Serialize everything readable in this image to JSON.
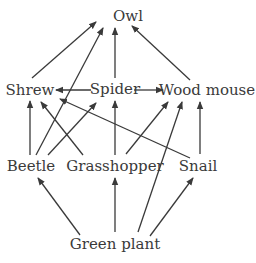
{
  "diagram": {
    "type": "food-web",
    "cut_off_caption": "...ing ... food ... web ... p",
    "colors": {
      "line": "#3a3a3a",
      "text": "#3a3a3a",
      "background": "#ffffff"
    },
    "nodes": {
      "owl": {
        "label": "Owl",
        "x": 128,
        "y": 16
      },
      "shrew": {
        "label": "Shrew",
        "x": 32,
        "y": 90
      },
      "spider": {
        "label": "Spider",
        "x": 115,
        "y": 88
      },
      "wood_mouse": {
        "label": "Wood mouse",
        "x": 205,
        "y": 90
      },
      "beetle": {
        "label": "Beetle",
        "x": 30,
        "y": 165
      },
      "grasshopper": {
        "label": "Grasshopper",
        "x": 115,
        "y": 165
      },
      "snail": {
        "label": "Snail",
        "x": 205,
        "y": 165
      },
      "green_plant": {
        "label": "Green plant",
        "x": 115,
        "y": 243
      }
    },
    "edges": [
      {
        "from": "shrew",
        "to": "owl"
      },
      {
        "from": "beetle",
        "to": "owl"
      },
      {
        "from": "spider",
        "to": "owl"
      },
      {
        "from": "wood_mouse",
        "to": "owl"
      },
      {
        "from": "spider",
        "to": "shrew"
      },
      {
        "from": "spider",
        "to": "wood_mouse"
      },
      {
        "from": "beetle",
        "to": "shrew"
      },
      {
        "from": "grasshopper",
        "to": "shrew"
      },
      {
        "from": "snail",
        "to": "shrew"
      },
      {
        "from": "beetle",
        "to": "spider"
      },
      {
        "from": "grasshopper",
        "to": "spider"
      },
      {
        "from": "grasshopper",
        "to": "wood_mouse"
      },
      {
        "from": "snail",
        "to": "wood_mouse"
      },
      {
        "from": "green_plant",
        "to": "wood_mouse"
      },
      {
        "from": "green_plant",
        "to": "beetle"
      },
      {
        "from": "green_plant",
        "to": "grasshopper"
      },
      {
        "from": "green_plant",
        "to": "snail"
      }
    ]
  }
}
